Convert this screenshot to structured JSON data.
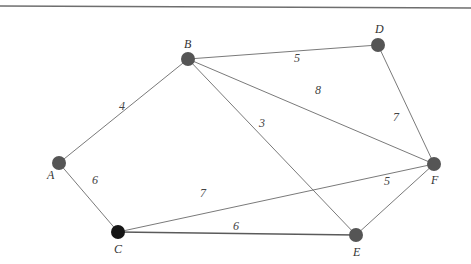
{
  "graph": {
    "type": "weighted-undirected",
    "nodes": [
      {
        "id": "A",
        "label": "A",
        "x": 59,
        "y": 163,
        "label_dx": -12,
        "label_dy": 16,
        "color": "#555555"
      },
      {
        "id": "B",
        "label": "B",
        "x": 188,
        "y": 59,
        "label_dx": -4,
        "label_dy": -11,
        "color": "#555555"
      },
      {
        "id": "C",
        "label": "C",
        "x": 118,
        "y": 232,
        "label_dx": -4,
        "label_dy": 21,
        "color": "#151515"
      },
      {
        "id": "D",
        "label": "D",
        "x": 378,
        "y": 45,
        "label_dx": -3,
        "label_dy": -12,
        "color": "#555555"
      },
      {
        "id": "E",
        "label": "E",
        "x": 356,
        "y": 235,
        "label_dx": -3,
        "label_dy": 21,
        "color": "#555555"
      },
      {
        "id": "F",
        "label": "F",
        "x": 434,
        "y": 164,
        "label_dx": -3,
        "label_dy": 20,
        "color": "#555555"
      }
    ],
    "edges": [
      {
        "from": "A",
        "to": "B",
        "weight": "4",
        "wx": 122,
        "wy": 110
      },
      {
        "from": "B",
        "to": "D",
        "weight": "5",
        "wx": 297,
        "wy": 62
      },
      {
        "from": "B",
        "to": "F",
        "weight": "8",
        "wx": 318,
        "wy": 94
      },
      {
        "from": "B",
        "to": "E",
        "weight": "3",
        "wx": 262,
        "wy": 127
      },
      {
        "from": "D",
        "to": "F",
        "weight": "7",
        "wx": 396,
        "wy": 121
      },
      {
        "from": "A",
        "to": "C",
        "weight": "6",
        "wx": 95,
        "wy": 184
      },
      {
        "from": "C",
        "to": "F",
        "weight": "7",
        "wx": 203,
        "wy": 197
      },
      {
        "from": "C",
        "to": "E",
        "weight": "6",
        "wx": 236,
        "wy": 230
      },
      {
        "from": "E",
        "to": "F",
        "weight": "5",
        "wx": 387,
        "wy": 185
      }
    ]
  }
}
